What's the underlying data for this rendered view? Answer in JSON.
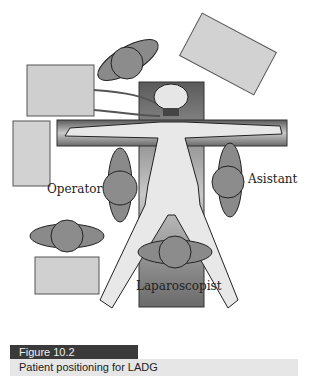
{
  "figure": {
    "labels": {
      "operator": "Operator",
      "assistant": "Asistant",
      "laparoscopist": "Laparoscopist"
    }
  },
  "caption": {
    "number": "Figure 10.2",
    "text": "Patient positioning for LADG"
  }
}
